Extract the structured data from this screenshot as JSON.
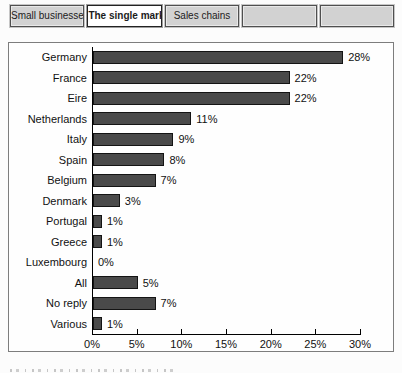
{
  "tabs": [
    {
      "label": "Small businesses",
      "active": false
    },
    {
      "label": "The single market",
      "active": true
    },
    {
      "label": "Sales chains",
      "active": false
    },
    {
      "label": "",
      "active": false
    },
    {
      "label": "",
      "active": false
    }
  ],
  "chart_data": {
    "type": "bar",
    "orientation": "horizontal",
    "title": "",
    "categories": [
      "Germany",
      "France",
      "Eire",
      "Netherlands",
      "Italy",
      "Spain",
      "Belgium",
      "Denmark",
      "Portugal",
      "Greece",
      "Luxembourg",
      "All",
      "No reply",
      "Various"
    ],
    "values": [
      28,
      22,
      22,
      11,
      9,
      8,
      7,
      3,
      1,
      1,
      0,
      5,
      7,
      1
    ],
    "value_labels": [
      "28%",
      "22%",
      "22%",
      "11%",
      "9%",
      "8%",
      "7%",
      "3%",
      "1%",
      "1%",
      "0%",
      "5%",
      "7%",
      "1%"
    ],
    "xlim": [
      0,
      30
    ],
    "x_tick_values": [
      0,
      5,
      10,
      15,
      20,
      25,
      30
    ],
    "x_ticks": [
      "0%",
      "5%",
      "10%",
      "15%",
      "20%",
      "25%",
      "30%"
    ],
    "grid": false,
    "legend": null,
    "bar_color": "#4a4a4a",
    "bar_border_color": "#141414"
  }
}
